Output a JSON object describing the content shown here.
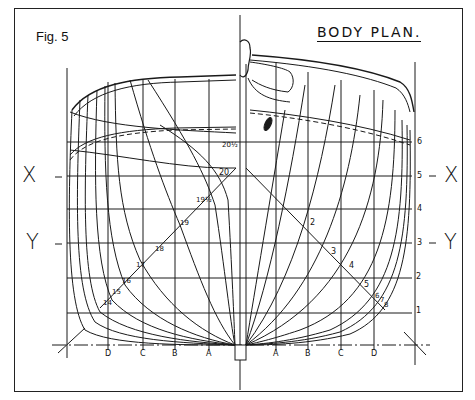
{
  "figure": {
    "label": "Fig. 5",
    "title": "BODY PLAN."
  },
  "waterline_refs": {
    "left": [
      {
        "label": "X",
        "dash": "–"
      },
      {
        "label": "Y",
        "dash": "–"
      }
    ],
    "right": [
      {
        "label": "X",
        "dash": "–"
      },
      {
        "label": "Y",
        "dash": "–"
      }
    ]
  },
  "waterline_numbers": [
    "1",
    "2",
    "3",
    "4",
    "5",
    "6"
  ],
  "buttock_labels_left": [
    "D",
    "C",
    "B",
    "A"
  ],
  "buttock_labels_right": [
    "A",
    "B",
    "C",
    "D"
  ],
  "aft_section_labels": [
    "20½",
    "20",
    "19½",
    "19",
    "18",
    "17",
    "16",
    "15",
    "14"
  ],
  "fwd_section_labels": [
    "2",
    "3",
    "4",
    "5",
    "6",
    "7",
    "8"
  ],
  "colors": {
    "line": "#1a1a1a",
    "background": "#ffffff"
  }
}
